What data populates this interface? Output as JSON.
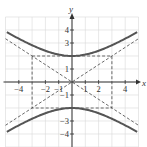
{
  "chart_data": {
    "type": "line",
    "title": "",
    "xlabel": "x",
    "ylabel": "y",
    "xlim": [
      -5,
      5
    ],
    "ylim": [
      -5,
      5
    ],
    "grid": true,
    "x_ticks": [
      -4,
      -2,
      -1,
      1,
      2,
      4
    ],
    "x_tick_labels": [
      "-4",
      "-2",
      "-1",
      "1",
      "2",
      "4"
    ],
    "y_ticks": [
      4,
      3,
      1,
      -1,
      -3,
      -4
    ],
    "y_tick_labels": [
      "4",
      "3",
      "1",
      "-1",
      "-3",
      "-4"
    ],
    "equation": "y^2/4 - x^2/9 = 1",
    "series": [
      {
        "name": "hyperbola upper branch",
        "style": "solid",
        "points": [
          [
            -5,
            3.89
          ],
          [
            -4,
            3.33
          ],
          [
            -3,
            2.83
          ],
          [
            -2,
            2.4
          ],
          [
            -1,
            2.11
          ],
          [
            0,
            2
          ],
          [
            1,
            2.11
          ],
          [
            2,
            2.4
          ],
          [
            3,
            2.83
          ],
          [
            4,
            3.33
          ],
          [
            5,
            3.89
          ]
        ]
      },
      {
        "name": "hyperbola lower branch",
        "style": "solid",
        "points": [
          [
            -5,
            -3.89
          ],
          [
            -4,
            -3.33
          ],
          [
            -3,
            -2.83
          ],
          [
            -2,
            -2.4
          ],
          [
            -1,
            -2.11
          ],
          [
            0,
            -2
          ],
          [
            1,
            -2.11
          ],
          [
            2,
            -2.4
          ],
          [
            3,
            -2.83
          ],
          [
            4,
            -3.33
          ],
          [
            5,
            -3.89
          ]
        ]
      },
      {
        "name": "asymptote y = 2x/3",
        "style": "dashed",
        "points": [
          [
            -5,
            -3.33
          ],
          [
            5,
            3.33
          ]
        ]
      },
      {
        "name": "asymptote y = -2x/3",
        "style": "dashed",
        "points": [
          [
            -5,
            3.33
          ],
          [
            5,
            -3.33
          ]
        ]
      },
      {
        "name": "central rectangle",
        "style": "dashed",
        "points": [
          [
            -3,
            2
          ],
          [
            3,
            2
          ],
          [
            3,
            -2
          ],
          [
            -3,
            -2
          ],
          [
            -3,
            2
          ]
        ]
      }
    ]
  },
  "labels": {
    "x_axis": "x",
    "y_axis": "y"
  }
}
